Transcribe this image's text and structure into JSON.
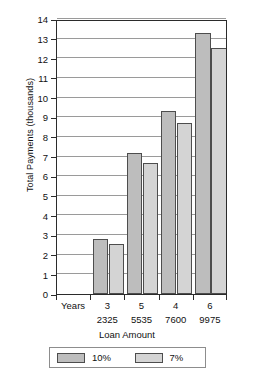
{
  "chart_data": {
    "type": "bar",
    "title": "",
    "xlabel": "Loan Amount",
    "ylabel": "Total Payments (thousands)",
    "categories": [
      "2325",
      "5535",
      "7600",
      "9975"
    ],
    "category_years": [
      "3",
      "5",
      "4",
      "6"
    ],
    "years_axis_label": "Years",
    "series": [
      {
        "name": "10%",
        "values": [
          2.8,
          7.2,
          9.3,
          13.3
        ],
        "color": "#bdbdbd"
      },
      {
        "name": "7%",
        "values": [
          2.55,
          6.65,
          8.7,
          12.5
        ],
        "color": "#d4d4d4"
      }
    ],
    "ylim": [
      0,
      14
    ],
    "yticks": [
      0,
      1,
      2,
      3,
      4,
      5,
      6,
      7,
      8,
      9,
      10,
      11,
      12,
      13,
      14
    ],
    "ytick_labels": [
      "0",
      "1",
      "2",
      "3",
      "4",
      "5",
      "6",
      "7",
      "8",
      "9",
      "10",
      "11",
      "12",
      "13",
      "14"
    ],
    "grid": true,
    "legend_position": "bottom",
    "legend_entries": [
      "10%",
      "7%"
    ]
  }
}
